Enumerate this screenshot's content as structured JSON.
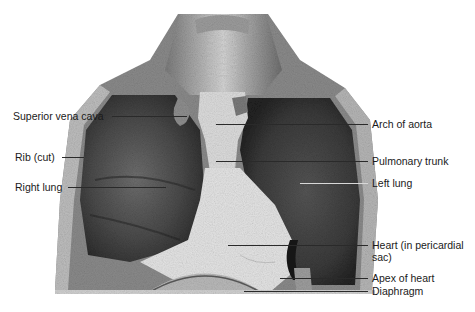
{
  "figure": {
    "labels_left": [
      {
        "text": "Superior vena cava",
        "x": 13,
        "y": 110
      },
      {
        "text": "Rib (cut)",
        "x": 15,
        "y": 151
      },
      {
        "text": "Right lung",
        "x": 15,
        "y": 181
      }
    ],
    "labels_right": [
      {
        "text": "Arch of aorta",
        "x": 372,
        "y": 118
      },
      {
        "text": "Pulmonary trunk",
        "x": 372,
        "y": 155
      },
      {
        "text": "Left lung",
        "x": 372,
        "y": 177
      },
      {
        "text": "Heart (in pericardial",
        "x": 372,
        "y": 240
      },
      {
        "text": "sac)",
        "x": 372,
        "y": 252
      },
      {
        "text": "Apex of heart",
        "x": 372,
        "y": 273
      },
      {
        "text": "Diaphragm",
        "x": 372,
        "y": 286
      }
    ],
    "colors": {
      "background": "#ffffff",
      "lung_dark": "#3f3f3f",
      "heart_pale": "#e6e6e6",
      "tissue_mid": "#9a9a9a",
      "label_text": "#1a1a1a",
      "leader_line": "#2a2a2a"
    }
  }
}
